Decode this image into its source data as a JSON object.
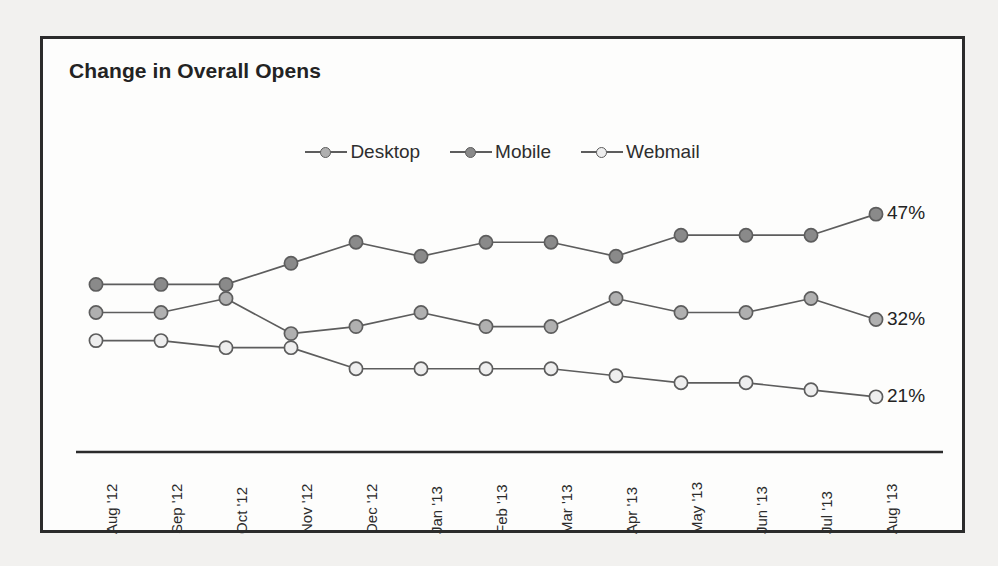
{
  "chart_data": {
    "type": "line",
    "title": "Change in Overall Opens",
    "xlabel": "",
    "ylabel": "",
    "grid": false,
    "legend_position": "top-center",
    "categories": [
      "Aug '12",
      "Sep '12",
      "Oct '12",
      "Nov '12",
      "Dec '12",
      "Jan '13",
      "Feb '13",
      "Mar '13",
      "Apr '13",
      "May '13",
      "Jun '13",
      "Jul '13",
      "Aug '13"
    ],
    "ylim": [
      15,
      52
    ],
    "series": [
      {
        "name": "Desktop",
        "color": "#b0b0b0",
        "end_label": "32%",
        "values": [
          33,
          33,
          35,
          30,
          31,
          33,
          31,
          31,
          35,
          33,
          33,
          35,
          32
        ]
      },
      {
        "name": "Mobile",
        "color": "#8a8a8a",
        "end_label": "47%",
        "values": [
          37,
          37,
          37,
          40,
          43,
          41,
          43,
          43,
          41,
          44,
          44,
          44,
          47
        ]
      },
      {
        "name": "Webmail",
        "color": "#eeeeee",
        "end_label": "21%",
        "values": [
          29,
          29,
          28,
          28,
          25,
          25,
          25,
          25,
          24,
          23,
          23,
          22,
          21
        ]
      }
    ],
    "annotations": [
      {
        "text": "47%",
        "series": "Mobile",
        "at": "Aug '13"
      },
      {
        "text": "32%",
        "series": "Desktop",
        "at": "Aug '13"
      },
      {
        "text": "21%",
        "series": "Webmail",
        "at": "Aug '13"
      }
    ]
  },
  "legend": {
    "items": [
      {
        "label": "Desktop"
      },
      {
        "label": "Mobile"
      },
      {
        "label": "Webmail"
      }
    ]
  },
  "axis": {
    "line_color": "#2b2b2b"
  },
  "style": {
    "frame_border": "#2b2b2b",
    "line_color": "#5d5d5d",
    "marker_stroke": "#5d5d5d",
    "page_background": "#f2f1ef",
    "plot_background": "#fdfdfc",
    "text_color": "#232323"
  }
}
